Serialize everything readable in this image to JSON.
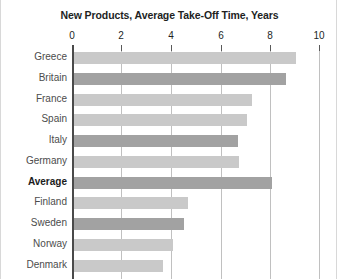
{
  "chart_data": {
    "type": "bar",
    "orientation": "horizontal",
    "title": "New Products, Average Take-Off Time, Years",
    "xlabel": "",
    "ylabel": "",
    "xlim": [
      0,
      10
    ],
    "xticks": [
      "0",
      "2",
      "4",
      "6",
      "8",
      "10"
    ],
    "xtick_values": [
      0,
      2,
      4,
      6,
      8,
      10
    ],
    "grid": true,
    "grid_axis": "x",
    "legend": "none",
    "categories": [
      "Greece",
      "Britain",
      "France",
      "Spain",
      "Italy",
      "Germany",
      "Average",
      "Finland",
      "Sweden",
      "Norway",
      "Denmark"
    ],
    "values": [
      9.0,
      8.6,
      7.2,
      7.0,
      6.65,
      6.7,
      8.0,
      4.6,
      4.45,
      4.0,
      3.6
    ],
    "bar_shades": [
      "light",
      "dark",
      "light",
      "light",
      "dark",
      "light",
      "dark",
      "light",
      "dark",
      "light",
      "light"
    ],
    "highlighted_categories": [
      "Average"
    ],
    "colors": {
      "bar_light": "#c9c9c9",
      "bar_dark": "#a2a2a2",
      "gridline": "#c0c0c0",
      "axis": "#4a4a4a",
      "title_text": "#221f1f",
      "label_text": "#4c4c4c",
      "highlight_text": "#1c1c1c",
      "background": "#ffffff"
    }
  }
}
